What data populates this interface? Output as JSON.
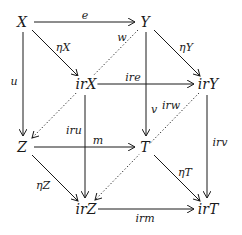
{
  "diagram": {
    "type": "commutative-cube",
    "nodes": {
      "X": "X",
      "Y": "Y",
      "irX": "irX",
      "irY": "irY",
      "Z": "Z",
      "T": "T",
      "irZ": "irZ",
      "irT": "irT"
    },
    "labels": {
      "e": "e",
      "eta_x": "ηX",
      "eta_y": "ηY",
      "w": "w",
      "u": "u",
      "ire": "ire",
      "v": "v",
      "iru": "iru",
      "irw": "irw",
      "irv": "irv",
      "m": "m",
      "eta_z": "ηZ",
      "eta_t": "ηT",
      "irm": "irm"
    },
    "edges": [
      {
        "from": "X",
        "to": "Y",
        "label": "e",
        "style": "solid"
      },
      {
        "from": "X",
        "to": "irX",
        "label": "ηX",
        "style": "solid"
      },
      {
        "from": "Y",
        "to": "irY",
        "label": "ηY",
        "style": "solid"
      },
      {
        "from": "X",
        "to": "Z",
        "label": "u",
        "style": "solid"
      },
      {
        "from": "Y",
        "to": "T",
        "label": "v",
        "style": "solid"
      },
      {
        "from": "Y",
        "to": "Z",
        "label": "w",
        "style": "dotted"
      },
      {
        "from": "irX",
        "to": "irY",
        "label": "ire",
        "style": "solid"
      },
      {
        "from": "irX",
        "to": "irZ",
        "label": "iru",
        "style": "solid"
      },
      {
        "from": "irY",
        "to": "irT",
        "label": "irv",
        "style": "solid"
      },
      {
        "from": "irY",
        "to": "irZ",
        "label": "irw",
        "style": "dotted"
      },
      {
        "from": "Z",
        "to": "T",
        "label": "m",
        "style": "solid"
      },
      {
        "from": "Z",
        "to": "irZ",
        "label": "ηZ",
        "style": "solid"
      },
      {
        "from": "T",
        "to": "irT",
        "label": "ηT",
        "style": "solid"
      },
      {
        "from": "irZ",
        "to": "irT",
        "label": "irm",
        "style": "solid"
      }
    ]
  }
}
